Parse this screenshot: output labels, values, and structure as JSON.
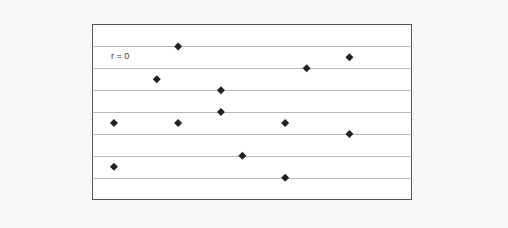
{
  "chart_data": {
    "type": "scatter",
    "title": "",
    "xlabel": "",
    "ylabel": "",
    "annotations": [
      {
        "text": "r = 0",
        "x": 0.9,
        "y": 6.3
      }
    ],
    "grid": true,
    "grid_axis": "y",
    "legend": null,
    "marker": "diamond",
    "xlim": [
      0,
      14.9
    ],
    "ylim": [
      0,
      8
    ],
    "x_ticks": [],
    "y_ticks": [],
    "series": [
      {
        "name": "data",
        "color": "#222222",
        "points": [
          {
            "x": 1,
            "y": 3.5
          },
          {
            "x": 1,
            "y": 1.5
          },
          {
            "x": 3,
            "y": 5.5
          },
          {
            "x": 4,
            "y": 7.0
          },
          {
            "x": 4,
            "y": 3.5
          },
          {
            "x": 6,
            "y": 5.0
          },
          {
            "x": 6,
            "y": 4.0
          },
          {
            "x": 7,
            "y": 2.0
          },
          {
            "x": 9,
            "y": 3.5
          },
          {
            "x": 9,
            "y": 1.0
          },
          {
            "x": 10,
            "y": 6.0
          },
          {
            "x": 12,
            "y": 6.5
          },
          {
            "x": 12,
            "y": 3.0
          }
        ]
      }
    ]
  },
  "annotation_label": "r = 0",
  "colors": {
    "background": "#f7f7f7",
    "plot_area": "#ffffff",
    "frame": "#555555",
    "gridline": "#b8b8b8",
    "marker": "#222222"
  }
}
